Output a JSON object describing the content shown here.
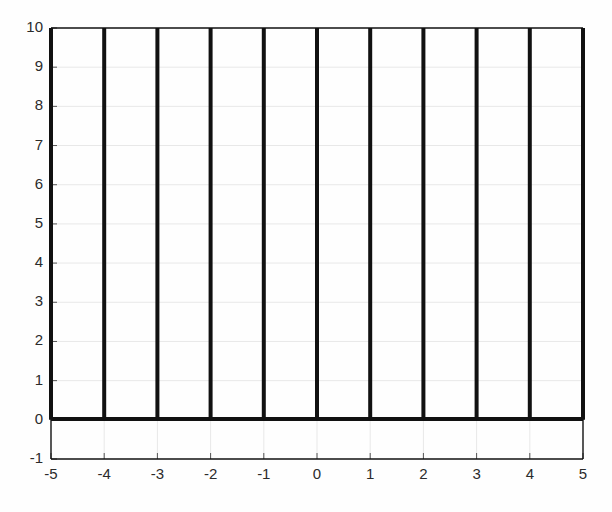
{
  "chart_data": {
    "type": "bar",
    "title": "",
    "subtitle": "",
    "xlabel": "",
    "ylabel": "",
    "xlim": [
      -5,
      5
    ],
    "ylim": [
      -1,
      10
    ],
    "grid": true,
    "legend": null,
    "annotations": [],
    "baseline": 0,
    "categories": [
      -5,
      -4,
      -3,
      -2,
      -1,
      0,
      1,
      2,
      3,
      4,
      5
    ],
    "values": [
      10,
      10,
      10,
      10,
      10,
      10,
      10,
      10,
      10,
      10,
      10
    ],
    "x_tick_labels": [
      "-5",
      "-4",
      "-3",
      "-2",
      "-1",
      "0",
      "1",
      "2",
      "3",
      "4",
      "5"
    ],
    "x_tick_values": [
      -5,
      -4,
      -3,
      -2,
      -1,
      0,
      1,
      2,
      3,
      4,
      5
    ],
    "y_tick_labels": [
      "-1",
      "0",
      "1",
      "2",
      "3",
      "4",
      "5",
      "6",
      "7",
      "8",
      "9",
      "10"
    ],
    "y_tick_values": [
      -1,
      0,
      1,
      2,
      3,
      4,
      5,
      6,
      7,
      8,
      9,
      10
    ],
    "series": [
      {
        "name": "impulses",
        "values": [
          10,
          10,
          10,
          10,
          10,
          10,
          10,
          10,
          10,
          10,
          10
        ]
      }
    ],
    "colors": {
      "line": "#111111",
      "axis": "#111111",
      "grid": "#e8e8e8",
      "background": "#fefefe",
      "tick_label": "#2b2b2b"
    }
  }
}
